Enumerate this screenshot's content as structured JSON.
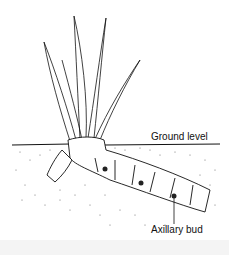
{
  "figure": {
    "labels": {
      "ground_level": "Ground level",
      "axillary_bud": "Axillary bud"
    },
    "parts": [
      "leaves",
      "rhizome",
      "axillary-buds",
      "soil",
      "ground-line"
    ],
    "leaf_count": 5,
    "bud_count": 3,
    "colors": {
      "line": "#111111",
      "background": "#ffffff",
      "soil_stipple": "#555555"
    }
  }
}
